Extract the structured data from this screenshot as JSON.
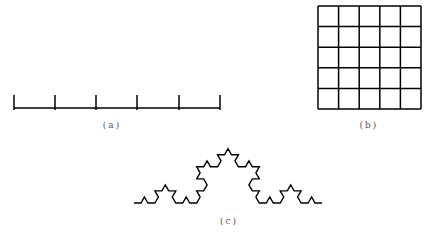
{
  "figure": {
    "panels": [
      {
        "id": "a",
        "label": "(a)",
        "description": "line segment divided into 5 equal parts",
        "segments": 5
      },
      {
        "id": "b",
        "label": "(b)",
        "description": "square divided into 5x5 grid",
        "rows": 5,
        "cols": 5
      },
      {
        "id": "c",
        "label": "(c)",
        "description": "Koch curve, 3rd iteration",
        "iterations": 3
      }
    ],
    "stroke_color": "#000000"
  }
}
